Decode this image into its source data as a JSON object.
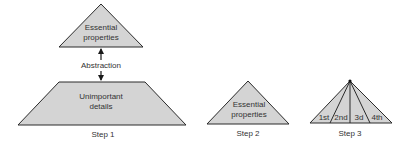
{
  "colors": {
    "shape_fill": "#d4d4d4",
    "stroke": "#2a2a2a",
    "text": "#333333"
  },
  "step1": {
    "top_shape_line1": "Essential",
    "top_shape_line2": "properties",
    "arrow_label": "Abstraction",
    "bottom_shape_line1": "Unimportant",
    "bottom_shape_line2": "details",
    "caption": "Step 1"
  },
  "step2": {
    "shape_line1": "Essential",
    "shape_line2": "properties",
    "caption": "Step 2"
  },
  "step3": {
    "segments": [
      "1st",
      "2nd",
      "3d",
      "4th"
    ],
    "caption": "Step 3"
  }
}
